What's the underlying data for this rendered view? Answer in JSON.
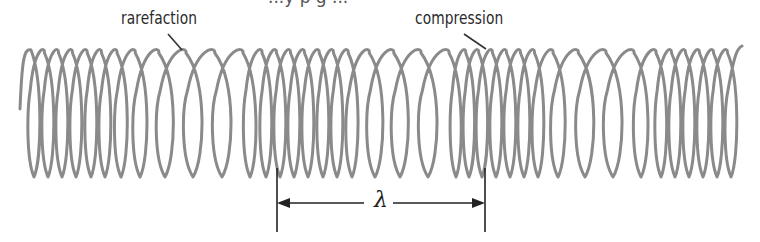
{
  "diagram": {
    "labels": {
      "rarefaction": "rarefaction",
      "compression": "compression",
      "wavelength_symbol": "λ"
    },
    "top_cutoff_text": "...y  p  g  ...",
    "colors": {
      "coil": "#8a8a8a",
      "text": "#2a2a2a",
      "leader_line": "#333333",
      "arrow": "#222222",
      "background": "#ffffff"
    },
    "coil": {
      "top_y": 50,
      "bottom_y": 177,
      "start_x": 20,
      "end_x": 742,
      "stroke_width": 3,
      "loop_centers_x": [
        34,
        48,
        62,
        76,
        91,
        105,
        121,
        140,
        165,
        193,
        222,
        250,
        266,
        280,
        294,
        308,
        323,
        337,
        352,
        375,
        400,
        428,
        456,
        469,
        482,
        496,
        510,
        524,
        538,
        558,
        585,
        613,
        641,
        661,
        675,
        689,
        703,
        717,
        731
      ]
    },
    "annotations": {
      "rarefaction_leader": {
        "x1": 168,
        "y1": 34,
        "x2": 182,
        "y2": 50
      },
      "compression_leader": {
        "x1": 464,
        "y1": 34,
        "x2": 486,
        "y2": 49
      },
      "wavelength": {
        "x_start": 277,
        "x_end": 485,
        "arrow_y": 203,
        "tick_top": 168,
        "tick_bottom": 232
      }
    }
  }
}
